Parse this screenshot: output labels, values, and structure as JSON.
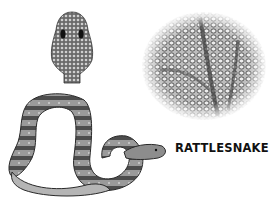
{
  "figure": {
    "label": "RATTLESNAKE",
    "illustrations": [
      {
        "name": "snake-head-top-view",
        "description": "scaled head seen from above"
      },
      {
        "name": "scale-closeup",
        "description": "circular close-up of snake scales"
      },
      {
        "name": "coiled-rattlesnake",
        "description": "coiled rattlesnake body drawing"
      }
    ]
  },
  "colors": {
    "background": "#ffffff",
    "ink": "#111111",
    "mid_gray": "#7a7a7a",
    "light_gray": "#cfcfcf"
  }
}
